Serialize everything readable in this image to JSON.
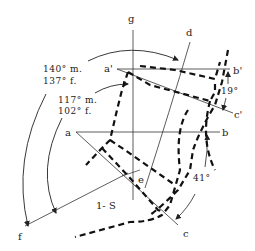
{
  "diagram": {
    "labels": {
      "g": "g",
      "d": "d",
      "a_prime": "a'",
      "b_prime": "b'",
      "c_prime": "c'",
      "a": "a",
      "b": "b",
      "c": "c",
      "e": "e",
      "f": "f",
      "segment": "1- S"
    },
    "angles": {
      "upper_male": "140° m.",
      "upper_female": "137° f.",
      "lower_male": "117° m.",
      "lower_female": "102° f.",
      "right_upper": "19°",
      "right_lower": "41°"
    },
    "colors": {
      "line": "#333333",
      "dashed_outline": "#111111",
      "background": "#ffffff"
    }
  }
}
